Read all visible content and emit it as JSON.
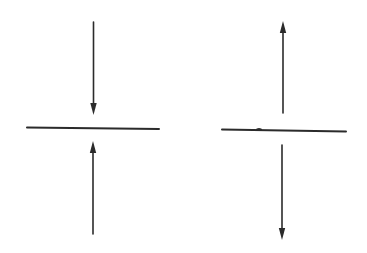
{
  "diagram": {
    "background": "#ffffff",
    "stroke_color": "#2b2b2b",
    "stroke_width": 1.6,
    "figures": [
      {
        "name": "compression-figure",
        "plane": {
          "x1": 27,
          "y1": 127.5,
          "x2": 159,
          "y2": 129
        },
        "arrows": [
          {
            "name": "top-arrow-down",
            "direction": "down",
            "x1": 93.5,
            "y1": 22,
            "x2": 93.5,
            "y2": 115
          },
          {
            "name": "bottom-arrow-up",
            "direction": "up",
            "x1": 93,
            "y1": 234,
            "x2": 93,
            "y2": 141
          }
        ]
      },
      {
        "name": "tension-figure",
        "plane": {
          "x1": 222,
          "y1": 129.5,
          "x2": 346,
          "y2": 131.5
        },
        "arrows": [
          {
            "name": "top-arrow-up",
            "direction": "up",
            "x1": 283,
            "y1": 113,
            "x2": 283,
            "y2": 21
          },
          {
            "name": "bottom-arrow-down",
            "direction": "down",
            "x1": 282,
            "y1": 145,
            "x2": 282,
            "y2": 240
          }
        ]
      }
    ]
  }
}
